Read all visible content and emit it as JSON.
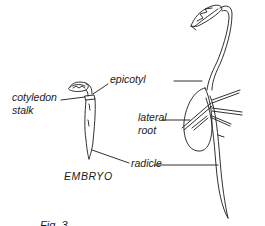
{
  "figure": {
    "labels": {
      "epicotyl": "epicotyl",
      "cotyledon_stalk_line1": "cotyledon",
      "cotyledon_stalk_line2": "stalk",
      "lateral_root_line1": "lateral",
      "lateral_root_line2": "root",
      "radicle": "radicle",
      "embryo": "EMBRYO"
    },
    "caption": "Fig. 3",
    "colors": {
      "ink": "#1a1a1a",
      "background": "#ffffff"
    }
  }
}
